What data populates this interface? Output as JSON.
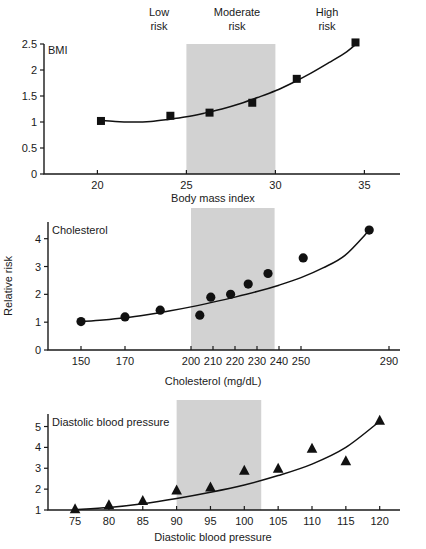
{
  "figure": {
    "risk_zones": [
      {
        "id": "low",
        "line1": "Low",
        "line2": "risk"
      },
      {
        "id": "moderate",
        "line1": "Moderate",
        "line2": "risk"
      },
      {
        "id": "high",
        "line1": "High",
        "line2": "risk"
      }
    ],
    "band_color": "#d2d2d2",
    "marker_color": "#111111",
    "shared_ylabel": "Relative risk"
  },
  "chart_data": [
    {
      "type": "scatter",
      "id": "bmi",
      "title": "BMI",
      "series_label": "BMI",
      "marker": "square",
      "xlabel": "Body mass index",
      "ylabel": "",
      "xlim": [
        17,
        37
      ],
      "ylim": [
        0,
        2.5
      ],
      "xticks": [
        20,
        25,
        30,
        35
      ],
      "xtick_labels": [
        "20",
        "25",
        "30",
        "35"
      ],
      "yticks": [
        0,
        0.5,
        1,
        1.5,
        2,
        2.5
      ],
      "ytick_labels": [
        "0",
        "0.5",
        "1",
        "1.5",
        "2",
        "2.5"
      ],
      "band": [
        25,
        30
      ],
      "grid": false,
      "points": [
        {
          "x": 20.2,
          "y": 1.02
        },
        {
          "x": 24.1,
          "y": 1.12
        },
        {
          "x": 26.3,
          "y": 1.18
        },
        {
          "x": 28.7,
          "y": 1.37
        },
        {
          "x": 31.2,
          "y": 1.83
        },
        {
          "x": 34.5,
          "y": 2.53
        }
      ],
      "curve": [
        {
          "x": 20.0,
          "y": 1.04
        },
        {
          "x": 21.0,
          "y": 1.01
        },
        {
          "x": 22.0,
          "y": 1.0
        },
        {
          "x": 23.0,
          "y": 1.01
        },
        {
          "x": 24.0,
          "y": 1.05
        },
        {
          "x": 25.0,
          "y": 1.1
        },
        {
          "x": 26.0,
          "y": 1.17
        },
        {
          "x": 27.0,
          "y": 1.25
        },
        {
          "x": 28.0,
          "y": 1.35
        },
        {
          "x": 29.0,
          "y": 1.47
        },
        {
          "x": 30.0,
          "y": 1.6
        },
        {
          "x": 31.0,
          "y": 1.76
        },
        {
          "x": 32.0,
          "y": 1.94
        },
        {
          "x": 33.0,
          "y": 2.14
        },
        {
          "x": 34.0,
          "y": 2.35
        },
        {
          "x": 34.6,
          "y": 2.52
        }
      ]
    },
    {
      "type": "scatter",
      "id": "cholesterol",
      "title": "Cholesterol",
      "series_label": "Cholesterol",
      "marker": "circle",
      "xlabel": "Cholesterol (mg/dL)",
      "ylabel": "Relative risk",
      "xlim": [
        135,
        295
      ],
      "ylim": [
        0,
        4.6
      ],
      "xticks": [
        150,
        170,
        200,
        210,
        220,
        230,
        240,
        250,
        290
      ],
      "xtick_labels": [
        "150",
        "170",
        "200",
        "210",
        "220",
        "230",
        "240",
        "250",
        "290"
      ],
      "yticks": [
        0,
        1,
        2,
        3,
        4
      ],
      "ytick_labels": [
        "0",
        "1",
        "2",
        "3",
        "4"
      ],
      "band": [
        200,
        238
      ],
      "grid": false,
      "points": [
        {
          "x": 150,
          "y": 1.02
        },
        {
          "x": 170,
          "y": 1.19
        },
        {
          "x": 186,
          "y": 1.43
        },
        {
          "x": 204,
          "y": 1.25
        },
        {
          "x": 209,
          "y": 1.9
        },
        {
          "x": 218,
          "y": 2.0
        },
        {
          "x": 226,
          "y": 2.37
        },
        {
          "x": 235,
          "y": 2.75
        },
        {
          "x": 251,
          "y": 3.31
        },
        {
          "x": 281,
          "y": 4.31
        }
      ],
      "curve": [
        {
          "x": 150,
          "y": 1.02
        },
        {
          "x": 160,
          "y": 1.08
        },
        {
          "x": 170,
          "y": 1.16
        },
        {
          "x": 180,
          "y": 1.27
        },
        {
          "x": 190,
          "y": 1.4
        },
        {
          "x": 200,
          "y": 1.55
        },
        {
          "x": 210,
          "y": 1.72
        },
        {
          "x": 220,
          "y": 1.9
        },
        {
          "x": 230,
          "y": 2.1
        },
        {
          "x": 240,
          "y": 2.33
        },
        {
          "x": 250,
          "y": 2.6
        },
        {
          "x": 260,
          "y": 2.95
        },
        {
          "x": 270,
          "y": 3.4
        },
        {
          "x": 281,
          "y": 4.3
        }
      ]
    },
    {
      "type": "scatter",
      "id": "diastolic-blood-pressure",
      "title": "Diastolic blood pressure",
      "series_label": "Diastolic blood pressure",
      "marker": "triangle",
      "xlabel": "Diastolic blood pressure",
      "ylabel": "",
      "xlim": [
        71,
        123
      ],
      "ylim": [
        1,
        5.6
      ],
      "xticks": [
        75,
        80,
        85,
        90,
        95,
        100,
        105,
        110,
        115,
        120
      ],
      "xtick_labels": [
        "75",
        "80",
        "85",
        "90",
        "95",
        "100",
        "105",
        "110",
        "115",
        "120"
      ],
      "yticks": [
        1,
        2,
        3,
        4,
        5
      ],
      "ytick_labels": [
        "1",
        "2",
        "3",
        "4",
        "5"
      ],
      "band": [
        90,
        102.5
      ],
      "grid": false,
      "points": [
        {
          "x": 75,
          "y": 1.05
        },
        {
          "x": 80,
          "y": 1.25
        },
        {
          "x": 85,
          "y": 1.45
        },
        {
          "x": 90,
          "y": 1.95
        },
        {
          "x": 95,
          "y": 2.1
        },
        {
          "x": 100,
          "y": 2.9
        },
        {
          "x": 105,
          "y": 3.0
        },
        {
          "x": 110,
          "y": 3.95
        },
        {
          "x": 115,
          "y": 3.35
        },
        {
          "x": 120,
          "y": 5.3
        }
      ],
      "curve": [
        {
          "x": 75,
          "y": 1.02
        },
        {
          "x": 80,
          "y": 1.12
        },
        {
          "x": 85,
          "y": 1.3
        },
        {
          "x": 90,
          "y": 1.55
        },
        {
          "x": 95,
          "y": 1.85
        },
        {
          "x": 100,
          "y": 2.2
        },
        {
          "x": 105,
          "y": 2.65
        },
        {
          "x": 110,
          "y": 3.2
        },
        {
          "x": 115,
          "y": 4.0
        },
        {
          "x": 120,
          "y": 5.25
        }
      ]
    }
  ]
}
